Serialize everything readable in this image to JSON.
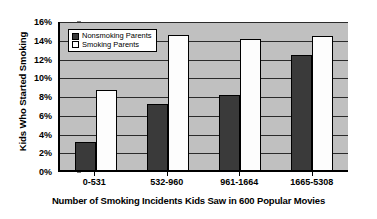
{
  "chart_data": {
    "type": "bar",
    "title": "",
    "xlabel": "Number of Smoking Incidents Kids Saw in 600 Popular Movies",
    "ylabel": "Kids Who Started Smoking",
    "categories": [
      "0-531",
      "532-960",
      "961-1664",
      "1665-5308"
    ],
    "series": [
      {
        "name": "Nonsmoking Parents",
        "color": "#3a3a3a",
        "values": [
          3.0,
          7.0,
          8.0,
          12.3
        ]
      },
      {
        "name": "Smoking Parents",
        "color": "#ffffff",
        "values": [
          8.5,
          14.4,
          14.0,
          14.3
        ]
      }
    ],
    "ylim": [
      0,
      16
    ],
    "y_tick_values": [
      0,
      2,
      4,
      6,
      8,
      10,
      12,
      14,
      16
    ],
    "y_tick_labels": [
      "0%",
      "2%",
      "4%",
      "6%",
      "8%",
      "10%",
      "12%",
      "14%",
      "16%"
    ],
    "y_tick_suffix": "%",
    "grid": true,
    "grid_axis": "y",
    "legend_position": "upper-left-inside",
    "plot_background": "#c0c0c0",
    "axis_color": "#000000",
    "gridline_color": "#2b2b2b"
  }
}
